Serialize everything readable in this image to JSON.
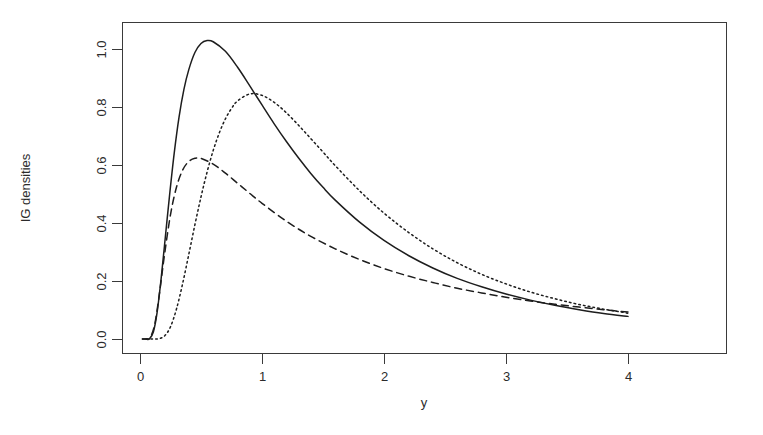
{
  "figure": {
    "background_color": "#ffffff",
    "ink_color": "#1d1d1d"
  },
  "chart_data": {
    "type": "line",
    "title": "",
    "xlabel": "y",
    "ylabel": "IG densities",
    "xlim": [
      -0.02,
      4.2
    ],
    "ylim": [
      -0.02,
      1.12
    ],
    "grid": false,
    "legend": "none",
    "xticks": [
      0,
      1,
      2,
      3,
      4
    ],
    "xtick_labels": [
      "0",
      "1",
      "2",
      "3",
      "4"
    ],
    "yticks": [
      0.0,
      0.2,
      0.4,
      0.6,
      0.8,
      1.0
    ],
    "ytick_labels": [
      "0.0",
      "0.2",
      "0.4",
      "0.6",
      "0.8",
      "1.0"
    ],
    "series": [
      {
        "name": "IG solid",
        "linestyle": "solid",
        "color": "#1d1d1d",
        "peak_x": 0.38,
        "peak_y": 1.05,
        "params": {
          "mu": 1.0,
          "lambda": 2.0
        },
        "x": [
          0.02,
          0.05,
          0.08,
          0.11,
          0.14,
          0.17,
          0.2,
          0.24,
          0.28,
          0.32,
          0.36,
          0.4,
          0.45,
          0.5,
          0.55,
          0.6,
          0.7,
          0.8,
          0.9,
          1.0,
          1.1,
          1.2,
          1.3,
          1.4,
          1.5,
          1.6,
          1.8,
          2.0,
          2.2,
          2.4,
          2.6,
          2.8,
          3.0,
          3.2,
          3.4,
          3.6,
          3.8,
          4.0
        ],
        "y": [
          0.0,
          0.0,
          0.002,
          0.025,
          0.091,
          0.196,
          0.319,
          0.486,
          0.639,
          0.765,
          0.861,
          0.929,
          0.988,
          1.019,
          1.029,
          1.025,
          0.992,
          0.937,
          0.873,
          0.807,
          0.742,
          0.681,
          0.624,
          0.571,
          0.523,
          0.479,
          0.403,
          0.34,
          0.288,
          0.245,
          0.209,
          0.18,
          0.155,
          0.134,
          0.116,
          0.101,
          0.088,
          0.078
        ]
      },
      {
        "name": "IG dotted",
        "linestyle": "dotted",
        "color": "#1d1d1d",
        "peak_x": 0.75,
        "peak_y": 0.98,
        "params": {
          "mu": 1.0,
          "lambda": 3.0
        },
        "x": [
          0.05,
          0.1,
          0.15,
          0.2,
          0.25,
          0.3,
          0.35,
          0.4,
          0.45,
          0.5,
          0.55,
          0.6,
          0.65,
          0.7,
          0.75,
          0.8,
          0.9,
          1.0,
          1.1,
          1.2,
          1.3,
          1.4,
          1.5,
          1.6,
          1.8,
          2.0,
          2.2,
          2.4,
          2.6,
          2.8,
          3.0,
          3.2,
          3.4,
          3.6,
          3.8,
          4.0
        ],
        "y": [
          0.0,
          0.0,
          0.001,
          0.01,
          0.042,
          0.105,
          0.192,
          0.292,
          0.394,
          0.49,
          0.576,
          0.65,
          0.711,
          0.759,
          0.795,
          0.821,
          0.845,
          0.84,
          0.816,
          0.78,
          0.737,
          0.691,
          0.645,
          0.598,
          0.511,
          0.434,
          0.368,
          0.311,
          0.263,
          0.223,
          0.19,
          0.162,
          0.139,
          0.119,
          0.103,
          0.089
        ]
      },
      {
        "name": "IG dashed",
        "linestyle": "dashed",
        "color": "#1d1d1d",
        "peak_x": 0.39,
        "peak_y": 0.615,
        "params": {
          "mu": 2.0,
          "lambda": 1.0
        },
        "x": [
          0.02,
          0.05,
          0.08,
          0.12,
          0.16,
          0.2,
          0.25,
          0.3,
          0.35,
          0.4,
          0.45,
          0.5,
          0.6,
          0.7,
          0.8,
          0.9,
          1.0,
          1.2,
          1.4,
          1.6,
          1.8,
          2.0,
          2.2,
          2.4,
          2.6,
          2.8,
          3.0,
          3.2,
          3.4,
          3.6,
          3.8,
          4.0
        ],
        "y": [
          0.0,
          0.0,
          0.003,
          0.049,
          0.159,
          0.288,
          0.429,
          0.525,
          0.583,
          0.612,
          0.623,
          0.623,
          0.603,
          0.572,
          0.537,
          0.502,
          0.468,
          0.406,
          0.354,
          0.311,
          0.274,
          0.243,
          0.217,
          0.195,
          0.175,
          0.159,
          0.144,
          0.131,
          0.12,
          0.11,
          0.101,
          0.093
        ]
      }
    ]
  },
  "axes": {
    "x_axis_label": "y",
    "y_axis_label": "IG densities"
  }
}
